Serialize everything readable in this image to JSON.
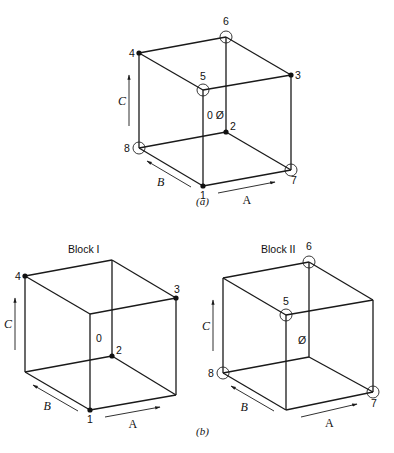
{
  "figure": {
    "subfigures": [
      {
        "id": "a",
        "caption": "(a)",
        "caption_pos": [
          196,
          205
        ],
        "title": "",
        "center_label": "0 Ø",
        "center_pos": [
          207,
          119
        ],
        "axis_labels": {
          "A": "A",
          "B": "B",
          "C": "C"
        },
        "vertices": {
          "tl_back": [
            139,
            53
          ],
          "tr_back": [
            226,
            37
          ],
          "r": [
            291,
            75
          ],
          "f_top": [
            203,
            90
          ],
          "bl_back": [
            139,
            148
          ],
          "b_back": [
            226,
            132
          ],
          "br": [
            291,
            170
          ],
          "f_bot": [
            203,
            186
          ]
        },
        "points": [
          {
            "label": "4",
            "vertex": "tl_back",
            "marker": "dot",
            "lx": -10,
            "ly": 4
          },
          {
            "label": "6",
            "vertex": "tr_back",
            "marker": "ring",
            "lx": -3,
            "ly": -12
          },
          {
            "label": "3",
            "vertex": "r",
            "marker": "dot",
            "lx": 4,
            "ly": 4
          },
          {
            "label": "5",
            "vertex": "f_top",
            "marker": "ring",
            "lx": -3,
            "ly": -10
          },
          {
            "label": "8",
            "vertex": "bl_back",
            "marker": "ring",
            "lx": -15,
            "ly": 4
          },
          {
            "label": "2",
            "vertex": "b_back",
            "marker": "dot",
            "lx": 4,
            "ly": -2
          },
          {
            "label": "7",
            "vertex": "br",
            "marker": "ring",
            "lx": 0,
            "ly": 14
          },
          {
            "label": "1",
            "vertex": "f_bot",
            "marker": "dot",
            "lx": -3,
            "ly": 13
          }
        ]
      },
      {
        "id": "b1",
        "caption": "",
        "title": "Block I",
        "title_pos": [
          68,
          253
        ],
        "center_label": "0",
        "center_pos": [
          96,
          342
        ],
        "axis_labels": {
          "A": "A",
          "B": "B",
          "C": "C"
        },
        "vertices": {
          "tl_back": [
            25,
            276
          ],
          "tr_back": [
            112,
            260
          ],
          "r": [
            176,
            298
          ],
          "f_top": [
            90,
            314
          ],
          "bl_back": [
            25,
            372
          ],
          "b_back": [
            112,
            356
          ],
          "br": [
            176,
            395
          ],
          "f_bot": [
            90,
            410
          ]
        },
        "points": [
          {
            "label": "4",
            "vertex": "tl_back",
            "marker": "dot",
            "lx": -10,
            "ly": 4
          },
          {
            "label": "3",
            "vertex": "r",
            "marker": "dot",
            "lx": -2,
            "ly": -5
          },
          {
            "label": "2",
            "vertex": "b_back",
            "marker": "dot",
            "lx": 4,
            "ly": -2
          },
          {
            "label": "1",
            "vertex": "f_bot",
            "marker": "dot",
            "lx": -3,
            "ly": 13
          }
        ]
      },
      {
        "id": "b2",
        "caption": "(b)",
        "caption_pos": [
          196,
          435
        ],
        "title": "Block II",
        "title_pos": [
          261,
          253
        ],
        "center_label": "Ø",
        "center_pos": [
          298,
          344
        ],
        "axis_labels": {
          "A": "A",
          "B": "B",
          "C": "C"
        },
        "vertices": {
          "tl_back": [
            223,
            278
          ],
          "tr_back": [
            309,
            262
          ],
          "r": [
            373,
            300
          ],
          "f_top": [
            286,
            315
          ],
          "bl_back": [
            223,
            373
          ],
          "b_back": [
            309,
            357
          ],
          "br": [
            373,
            392
          ],
          "f_bot": [
            286,
            410
          ]
        },
        "points": [
          {
            "label": "6",
            "vertex": "tr_back",
            "marker": "ring",
            "lx": -3,
            "ly": -12
          },
          {
            "label": "5",
            "vertex": "f_top",
            "marker": "ring",
            "lx": -3,
            "ly": -10
          },
          {
            "label": "8",
            "vertex": "bl_back",
            "marker": "ring",
            "lx": -15,
            "ly": 4
          },
          {
            "label": "7",
            "vertex": "br",
            "marker": "ring",
            "lx": -2,
            "ly": 15
          }
        ]
      }
    ],
    "colors": {
      "ink": "#1a1a1a",
      "background": "#ffffff"
    }
  }
}
